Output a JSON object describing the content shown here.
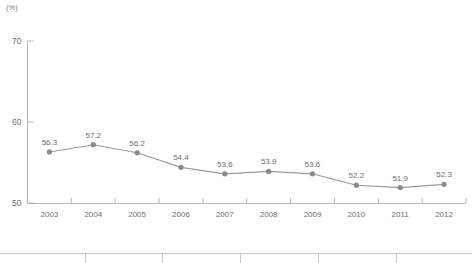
{
  "chart_data": {
    "type": "line",
    "title": "",
    "subtitle": "",
    "xlabel": "",
    "ylabel": "",
    "unit_label": "(%)",
    "categories": [
      "2003",
      "2004",
      "2005",
      "2006",
      "2007",
      "2008",
      "2009",
      "2010",
      "2011",
      "2012"
    ],
    "values": [
      56.3,
      57.2,
      56.2,
      54.4,
      53.6,
      53.9,
      53.6,
      52.2,
      51.9,
      52.3
    ],
    "data_labels": [
      "56.3",
      "57.2",
      "56.2",
      "54.4",
      "53.6",
      "53.9",
      "53.6",
      "52.2",
      "51.9",
      "52.3"
    ],
    "ylim": [
      50,
      70
    ],
    "yticks": [
      50,
      60,
      70
    ],
    "ytick_labels": [
      "50",
      "60",
      "70"
    ],
    "grid": false,
    "legend": false,
    "legend_position": "none",
    "series": [
      {
        "name": "",
        "values": [
          56.3,
          57.2,
          56.2,
          54.4,
          53.6,
          53.9,
          53.6,
          52.2,
          51.9,
          52.3
        ],
        "line_color": "#9a9a9a",
        "marker_color": "#8a8a8a",
        "marker": "circle"
      }
    ],
    "colors": {
      "line": "#9a9a9a",
      "marker": "#8a8a8a",
      "axis": "#b5b5b5",
      "text": "#6e6e6e",
      "table_rule": "#c9c9c9"
    }
  },
  "bottom_table": {
    "columns": [
      "",
      "",
      "",
      "",
      "",
      "",
      ""
    ],
    "rows": []
  }
}
